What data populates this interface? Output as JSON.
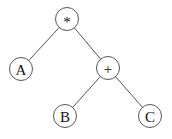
{
  "diagram": {
    "type": "expression-tree",
    "nodes": [
      {
        "id": "mul",
        "label": "*",
        "x": 67,
        "y": 19,
        "r": 11.5
      },
      {
        "id": "a",
        "label": "A",
        "x": 21,
        "y": 69,
        "r": 11.5
      },
      {
        "id": "add",
        "label": "+",
        "x": 108,
        "y": 68,
        "r": 11.5
      },
      {
        "id": "b",
        "label": "B",
        "x": 65,
        "y": 116,
        "r": 11.5
      },
      {
        "id": "c",
        "label": "C",
        "x": 150,
        "y": 116,
        "r": 11.5
      }
    ],
    "edges": [
      {
        "from": "mul",
        "to": "a"
      },
      {
        "from": "mul",
        "to": "add"
      },
      {
        "from": "add",
        "to": "b"
      },
      {
        "from": "add",
        "to": "c"
      }
    ],
    "colors": {
      "stroke": "#555555",
      "text": "#111111",
      "background": "#ffffff"
    }
  }
}
